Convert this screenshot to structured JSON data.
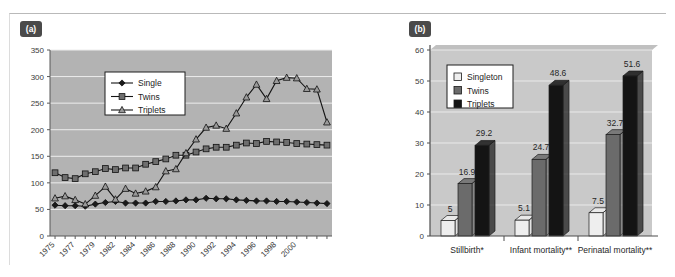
{
  "figure": {
    "panel_a_tag": "(a)",
    "panel_b_tag": "(b)"
  },
  "chart_data": [
    {
      "id": "panel-a",
      "type": "line",
      "title": "",
      "xlabel": "",
      "ylabel": "",
      "ylim": [
        0,
        350
      ],
      "yticks": [
        0,
        50,
        100,
        150,
        200,
        250,
        300,
        350
      ],
      "grid": true,
      "legend_position": "top-center-left",
      "x": [
        1975,
        1976,
        1977,
        1978,
        1979,
        1980,
        1981,
        1982,
        1983,
        1984,
        1985,
        1986,
        1987,
        1988,
        1989,
        1990,
        1991,
        1992,
        1993,
        1994,
        1995,
        1996,
        1997,
        1998,
        1999,
        2000,
        2001,
        2002
      ],
      "xtick_labels": [
        "1975",
        "",
        "1977",
        "",
        "1979",
        "",
        "1982",
        "",
        "1984",
        "",
        "1986",
        "",
        "1988",
        "",
        "1990",
        "",
        "1992",
        "",
        "1994",
        "",
        "1996",
        "",
        "1998",
        "",
        "2000",
        "",
        "",
        ""
      ],
      "series": [
        {
          "name": "Single",
          "marker": "diamond",
          "color": "#1a1a1a",
          "values": [
            58,
            57,
            57,
            56,
            60,
            63,
            65,
            62,
            62,
            62,
            65,
            65,
            66,
            68,
            68,
            71,
            70,
            70,
            68,
            67,
            66,
            66,
            65,
            65,
            64,
            63,
            62,
            61
          ]
        },
        {
          "name": "Twins",
          "marker": "square",
          "color": "#6e6e6e",
          "values": [
            119,
            110,
            108,
            117,
            121,
            127,
            125,
            128,
            128,
            135,
            140,
            145,
            152,
            152,
            158,
            164,
            167,
            167,
            171,
            175,
            174,
            178,
            177,
            176,
            174,
            173,
            172,
            171
          ]
        },
        {
          "name": "Triplets",
          "marker": "triangle",
          "color": "#9a9a9a",
          "values": [
            71,
            75,
            68,
            60,
            76,
            93,
            69,
            89,
            80,
            84,
            92,
            122,
            126,
            156,
            182,
            204,
            208,
            202,
            231,
            261,
            285,
            258,
            292,
            298,
            297,
            277,
            276,
            214
          ]
        }
      ]
    },
    {
      "id": "panel-b",
      "type": "bar",
      "title": "",
      "xlabel": "",
      "ylabel": "",
      "ylim": [
        0,
        60
      ],
      "yticks": [
        0,
        10,
        20,
        30,
        40,
        50,
        60
      ],
      "grid": true,
      "legend_position": "top-left",
      "categories": [
        "Stillbirth*",
        "Infant mortality**",
        "Perinatal mortality**"
      ],
      "series": [
        {
          "name": "Singleton",
          "color": "#eeeeee",
          "values": [
            5,
            5.1,
            7.5
          ],
          "labels": [
            "5",
            "5.1",
            "7.5"
          ]
        },
        {
          "name": "Twins",
          "color": "#6b6b6b",
          "values": [
            16.9,
            24.7,
            32.7
          ],
          "labels": [
            "16.9",
            "24.7",
            "32.7"
          ]
        },
        {
          "name": "Triplets",
          "color": "#141414",
          "values": [
            29.2,
            48.6,
            51.6
          ],
          "labels": [
            "29.2",
            "48.6",
            "51.6"
          ]
        }
      ]
    }
  ]
}
